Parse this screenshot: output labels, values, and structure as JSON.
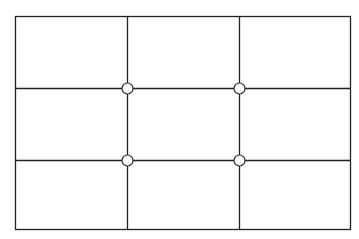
{
  "diagram": {
    "frame": {
      "x": 15,
      "y": 16,
      "width": 335,
      "height": 213
    },
    "vertical_lines_x": [
      127,
      239
    ],
    "horizontal_lines_y": [
      88,
      160
    ],
    "intersections": [
      {
        "x": 127,
        "y": 88
      },
      {
        "x": 239,
        "y": 88
      },
      {
        "x": 127,
        "y": 160
      },
      {
        "x": 239,
        "y": 160
      }
    ],
    "colors": {
      "line": "#222222",
      "background": "#ffffff",
      "point_fill": "#ffffff"
    }
  }
}
